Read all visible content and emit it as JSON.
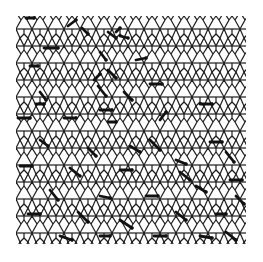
{
  "figure": {
    "background": "#ffffff",
    "line_color": "#1a1a1a",
    "bounds": {
      "x": 16,
      "y": 16,
      "width": 230,
      "height": 230
    },
    "period": {
      "dx": 16,
      "dy": 17
    },
    "marked_edges": [
      [
        26,
        18,
        34,
        18
      ],
      [
        68,
        26,
        76,
        20
      ],
      [
        82,
        28,
        88,
        34
      ],
      [
        108,
        32,
        116,
        38
      ],
      [
        116,
        32,
        120,
        28
      ],
      [
        120,
        36,
        128,
        38
      ],
      [
        44,
        48,
        58,
        48
      ],
      [
        100,
        52,
        106,
        60
      ],
      [
        108,
        70,
        116,
        78
      ],
      [
        136,
        60,
        146,
        58
      ],
      [
        30,
        66,
        38,
        66
      ],
      [
        94,
        80,
        100,
        74
      ],
      [
        98,
        86,
        106,
        96
      ],
      [
        124,
        92,
        132,
        100
      ],
      [
        150,
        84,
        162,
        84
      ],
      [
        40,
        92,
        46,
        100
      ],
      [
        36,
        104,
        44,
        104
      ],
      [
        100,
        110,
        112,
        110
      ],
      [
        160,
        120,
        166,
        112
      ],
      [
        200,
        104,
        212,
        104
      ],
      [
        18,
        118,
        30,
        118
      ],
      [
        64,
        118,
        76,
        118
      ],
      [
        108,
        122,
        116,
        122
      ],
      [
        150,
        140,
        160,
        150
      ],
      [
        210,
        142,
        222,
        142
      ],
      [
        40,
        140,
        48,
        146
      ],
      [
        88,
        148,
        96,
        156
      ],
      [
        130,
        146,
        140,
        152
      ],
      [
        176,
        160,
        186,
        164
      ],
      [
        226,
        152,
        234,
        162
      ],
      [
        20,
        166,
        32,
        166
      ],
      [
        70,
        168,
        80,
        176
      ],
      [
        120,
        170,
        132,
        170
      ],
      [
        180,
        172,
        190,
        180
      ],
      [
        230,
        180,
        242,
        180
      ],
      [
        50,
        190,
        58,
        200
      ],
      [
        100,
        196,
        110,
        198
      ],
      [
        146,
        196,
        158,
        196
      ],
      [
        196,
        186,
        206,
        192
      ],
      [
        236,
        196,
        244,
        204
      ],
      [
        28,
        214,
        40,
        214
      ],
      [
        78,
        212,
        88,
        222
      ],
      [
        120,
        220,
        132,
        228
      ],
      [
        176,
        212,
        186,
        220
      ],
      [
        216,
        214,
        226,
        214
      ],
      [
        60,
        236,
        72,
        240
      ],
      [
        100,
        236,
        110,
        236
      ],
      [
        154,
        236,
        166,
        236
      ],
      [
        200,
        236,
        212,
        238
      ],
      [
        226,
        232,
        236,
        240
      ]
    ]
  }
}
